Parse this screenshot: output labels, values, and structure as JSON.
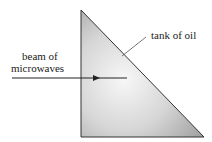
{
  "diagram": {
    "labels": {
      "tank": "tank of oil",
      "beam_line1": "beam of",
      "beam_line2": "microwaves"
    },
    "colors": {
      "outline": "#333333",
      "fill_dark": "#9a9a9a",
      "fill_light": "#f4f4f4"
    }
  }
}
